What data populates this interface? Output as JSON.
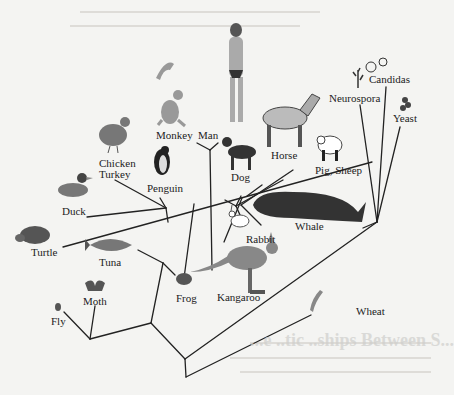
{
  "diagram": {
    "type": "phylogenetic-tree",
    "colors": {
      "background": "#f4f4f2",
      "branch": "#222222",
      "text": "#222222"
    },
    "taxa": [
      {
        "id": "man",
        "label": "Man"
      },
      {
        "id": "monkey",
        "label": "Monkey"
      },
      {
        "id": "chicken_turkey",
        "label": "Chicken\nTurkey",
        "line1": "Chicken",
        "line2": "Turkey"
      },
      {
        "id": "penguin",
        "label": "Penguin"
      },
      {
        "id": "duck",
        "label": "Duck"
      },
      {
        "id": "turtle",
        "label": "Turtle"
      },
      {
        "id": "tuna",
        "label": "Tuna"
      },
      {
        "id": "moth",
        "label": "Moth"
      },
      {
        "id": "fly",
        "label": "Fly"
      },
      {
        "id": "frog",
        "label": "Frog"
      },
      {
        "id": "kangaroo",
        "label": "Kangaroo"
      },
      {
        "id": "rabbit",
        "label": "Rabbit"
      },
      {
        "id": "dog",
        "label": "Dog"
      },
      {
        "id": "horse",
        "label": "Horse"
      },
      {
        "id": "pig_sheep",
        "label": "Pig, Sheep"
      },
      {
        "id": "whale",
        "label": "Whale"
      },
      {
        "id": "neurospora",
        "label": "Neurospora"
      },
      {
        "id": "candidas",
        "label": "Candidas"
      },
      {
        "id": "yeast",
        "label": "Yeast"
      },
      {
        "id": "wheat",
        "label": "Wheat"
      }
    ],
    "background_bleedthrough": {
      "heading_fragment": "...e ..tic ..ships Between S...",
      "note": "faint mirrored text from reverse page"
    }
  }
}
